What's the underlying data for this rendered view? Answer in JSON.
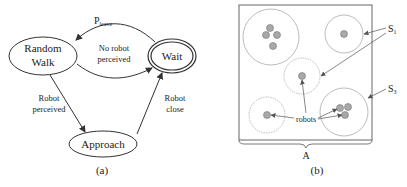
{
  "panel_a": {
    "caption": "(a)",
    "states": {
      "random_walk": {
        "line1": "Random",
        "line2": "Walk"
      },
      "wait": {
        "label": "Wait"
      },
      "approach": {
        "label": "Approach"
      }
    },
    "transitions": {
      "p_leave": {
        "main": "P",
        "sub": "leave"
      },
      "no_robot": {
        "line1": "No robot",
        "line2": "perceived"
      },
      "robot_perceived": {
        "line1": "Robot",
        "line2": "perceived"
      },
      "robot_close": {
        "line1": "Robot",
        "line2": "close"
      }
    }
  },
  "panel_b": {
    "caption": "(b)",
    "area_label": "A",
    "robots_label": "robots",
    "s1": {
      "main": "S",
      "sub": "1"
    },
    "s3": {
      "main": "S",
      "sub": "3"
    }
  },
  "colors": {
    "stroke": "#333333",
    "robot_fill": "#a8a8a8",
    "circle_stroke": "#999999"
  }
}
